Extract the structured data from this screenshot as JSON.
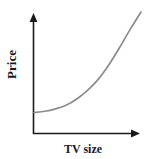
{
  "chart_data": {
    "type": "line",
    "title": "",
    "xlabel": "TV size",
    "ylabel": "Price",
    "grid": false,
    "legend": null,
    "axes": {
      "x_arrow": true,
      "y_arrow": true,
      "show_ticks": false,
      "show_tick_labels": false,
      "xlim": [
        0,
        1
      ],
      "ylim": [
        0,
        1
      ]
    },
    "series": [
      {
        "name": "Price vs TV size",
        "description": "increasing convex (exponential) curve",
        "color": "#8c8c8c",
        "x": [
          0.0,
          0.1,
          0.2,
          0.3,
          0.4,
          0.5,
          0.6,
          0.7,
          0.8,
          0.9,
          1.0
        ],
        "y": [
          0.18,
          0.19,
          0.21,
          0.24,
          0.29,
          0.36,
          0.45,
          0.57,
          0.71,
          0.86,
          1.0
        ]
      }
    ],
    "colors": {
      "axis": "#1a1a1a",
      "curve": "#8c8c8c",
      "background": "#ffffff",
      "label_text": "#1a1a1a"
    }
  },
  "labels": {
    "y_axis": "Price",
    "x_axis": "TV size"
  }
}
